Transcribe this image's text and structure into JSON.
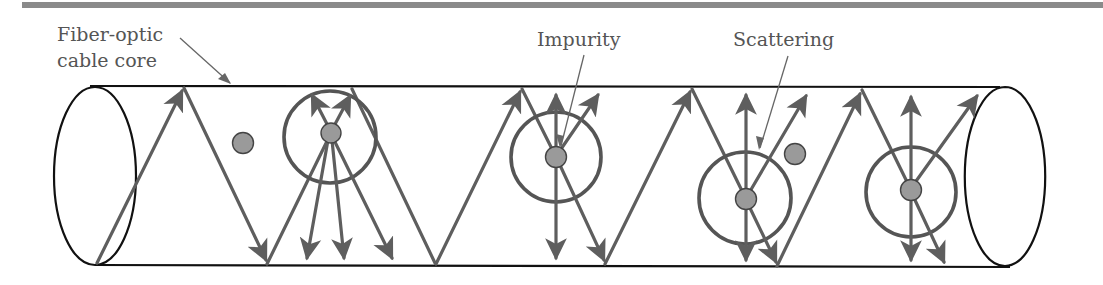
{
  "figure": {
    "header_bar_color": "#8a8a8a",
    "labels": {
      "cable_core_line1": "Fiber-optic",
      "cable_core_line2": "cable core",
      "impurity": "Impurity",
      "scattering": "Scattering"
    },
    "colors": {
      "outline": "#111111",
      "ray": "#5e5e5e",
      "ring": "#555555",
      "impurity_fill": "#9a9a9a",
      "label_text": "#555555"
    },
    "cable": {
      "top_y": 86,
      "bottom_y": 265,
      "left_end": {
        "cx": 95,
        "cy": 176,
        "rx": 40,
        "ry": 89
      },
      "right_end": {
        "cx": 1005,
        "cy": 176,
        "rx": 40,
        "ry": 89
      }
    },
    "impurities": [
      {
        "cx": 243,
        "cy": 143,
        "scatter_ring": false
      },
      {
        "cx": 331,
        "cy": 133,
        "scatter_ring": true,
        "ring_r": 46
      },
      {
        "cx": 556,
        "cy": 157,
        "scatter_ring": true,
        "ring_r": 45
      },
      {
        "cx": 746,
        "cy": 199,
        "scatter_ring": true,
        "ring_r": 46
      },
      {
        "cx": 795,
        "cy": 154,
        "scatter_ring": false
      },
      {
        "cx": 911,
        "cy": 190,
        "scatter_ring": true,
        "ring_r": 45
      }
    ]
  }
}
